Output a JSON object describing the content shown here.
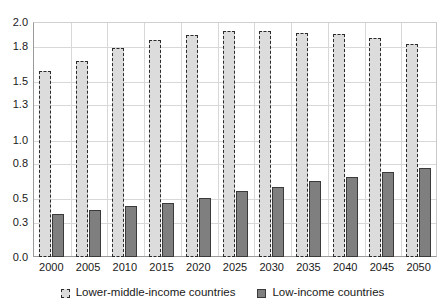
{
  "chart_data": {
    "type": "bar",
    "title": "",
    "subtitle": "",
    "xlabel": "",
    "ylabel": "",
    "categories": [
      "2000",
      "2005",
      "2010",
      "2015",
      "2020",
      "2025",
      "2030",
      "2035",
      "2040",
      "2045",
      "2050"
    ],
    "series": [
      {
        "name": "Lower-middle-income countries",
        "color": "#dcdcdc",
        "border_color": "#2b2b2b",
        "border_style": "dashed",
        "values": [
          1.58,
          1.67,
          1.78,
          1.85,
          1.89,
          1.92,
          1.92,
          1.91,
          1.9,
          1.86,
          1.81
        ]
      },
      {
        "name": "Low-income countries",
        "color": "#7f7f7f",
        "border_color": "#3a3a3a",
        "border_style": "solid",
        "values": [
          0.37,
          0.4,
          0.43,
          0.46,
          0.5,
          0.56,
          0.6,
          0.65,
          0.68,
          0.72,
          0.76
        ]
      }
    ],
    "ylim": [
      0.0,
      2.0
    ],
    "y_ticks": [
      0.0,
      0.3,
      0.5,
      0.8,
      1.0,
      1.3,
      1.5,
      1.8,
      2.0
    ],
    "y_tick_labels": [
      "0.0",
      "0.3",
      "0.5",
      "0.8",
      "1.0",
      "1.3",
      "1.5",
      "1.8",
      "2.0"
    ],
    "grid": true,
    "grid_axis": "both",
    "legend_position": "bottom",
    "legend_entries": [
      "Lower-middle-income countries",
      "Low-income countries"
    ]
  }
}
